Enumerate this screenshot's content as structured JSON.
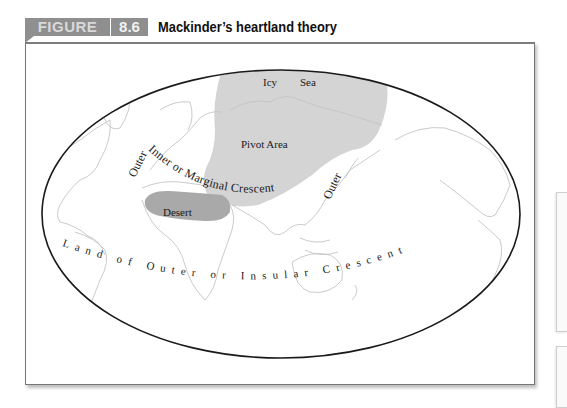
{
  "figure": {
    "label": "FIGURE",
    "number": "8.6",
    "title": "Mackinder’s heartland theory"
  },
  "map": {
    "labels": {
      "icy": "Icy",
      "sea": "Sea",
      "pivot_area": "Pivot Area",
      "inner_crescent": "Inner or Marginal Crescent",
      "outer_left": "Outer",
      "outer_right": "Outer",
      "desert": "Desert",
      "outer_crescent": "Land of Outer or Insular Crescent"
    },
    "colors": {
      "pivot_area": "#d4d4d4",
      "desert": "#a9a9a9",
      "coastline": "#c4c4c4",
      "ellipse": "#1a1a1a"
    }
  }
}
